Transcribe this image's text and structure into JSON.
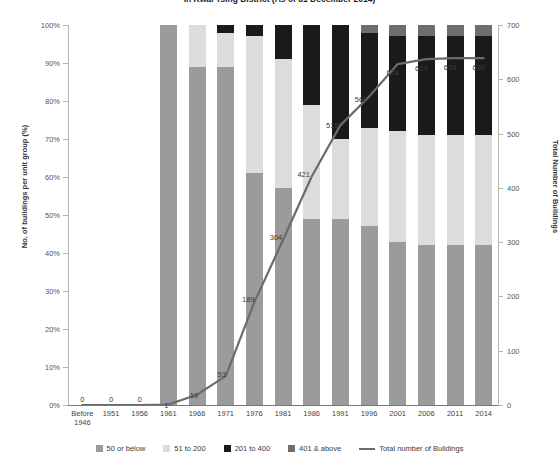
{
  "chart_data": {
    "type": "bar",
    "title": "in Kwai Tsing District (As of 31 December 2014)",
    "xlabel": "",
    "ylabel": "No. of buildings per unit group (%)",
    "ylabel_right": "Total Number of Buildings",
    "ylim": [
      0,
      100
    ],
    "ylim_right": [
      0,
      700
    ],
    "grid": false,
    "legend_position": "bottom",
    "categories": [
      "Before 1946",
      "1951",
      "1956",
      "1961",
      "1966",
      "1971",
      "1976",
      "1981",
      "1986",
      "1991",
      "1996",
      "2001",
      "2006",
      "2011",
      "2014"
    ],
    "y_ticks": [
      "0%",
      "10%",
      "20%",
      "30%",
      "40%",
      "50%",
      "60%",
      "70%",
      "80%",
      "90%",
      "100%"
    ],
    "y_ticks_right": [
      "0",
      "100",
      "200",
      "300",
      "400",
      "500",
      "600",
      "700"
    ],
    "series": [
      {
        "name": "50 or below",
        "color": "#9b9b9b",
        "values": [
          0,
          0,
          0,
          100,
          89,
          89,
          61,
          57,
          49,
          49,
          47,
          43,
          42,
          42,
          42
        ]
      },
      {
        "name": "51 to 200",
        "color": "#dcdcdc",
        "values": [
          0,
          0,
          0,
          0,
          11,
          9,
          36,
          34,
          30,
          21,
          26,
          29,
          29,
          29,
          29
        ]
      },
      {
        "name": "201 to 400",
        "color": "#1a1a1a",
        "values": [
          0,
          0,
          0,
          0,
          0,
          2,
          3,
          9,
          21,
          30,
          25,
          25,
          26,
          26,
          26
        ]
      },
      {
        "name": "401 & above",
        "color": "#6e6e6e",
        "values": [
          0,
          0,
          0,
          0,
          0,
          0,
          0,
          0,
          0,
          0,
          2,
          3,
          3,
          3,
          3
        ]
      }
    ],
    "line_series": {
      "name": "Total number of Buildings",
      "color": "#6b6b6b",
      "values": [
        0,
        0,
        0,
        1,
        19,
        53,
        189,
        304,
        421,
        515,
        568,
        628,
        637,
        639,
        639
      ],
      "labels": [
        "0",
        "0",
        "0",
        "1",
        "19",
        "53",
        "189",
        "304",
        "421",
        "515",
        "568",
        "628",
        "637",
        "639",
        "639"
      ]
    }
  },
  "legend": {
    "items": [
      {
        "label": "50 or below",
        "color": "#9b9b9b",
        "type": "swatch"
      },
      {
        "label": "51 to 200",
        "color": "#dcdcdc",
        "type": "swatch"
      },
      {
        "label": "201 to 400",
        "color": "#1a1a1a",
        "type": "swatch"
      },
      {
        "label": "401 & above",
        "color": "#6e6e6e",
        "type": "swatch"
      },
      {
        "label": "Total number of Buildings",
        "color": "#6b6b6b",
        "type": "line"
      }
    ]
  }
}
